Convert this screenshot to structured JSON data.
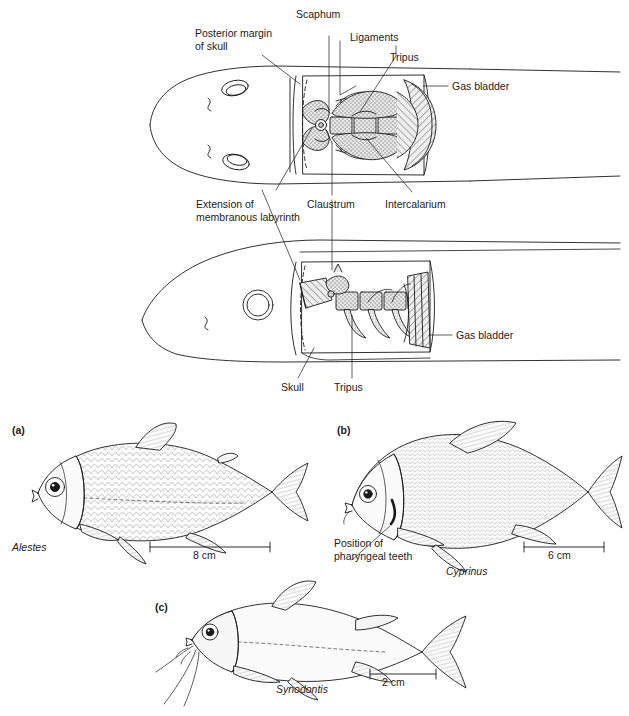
{
  "figure": {
    "background_color": "#ffffff",
    "line_color": "#1a1a1a",
    "stipple_fill": "#b8b8b8",
    "light_fill": "#f2f2f2",
    "hatch_fill": "#cccccc"
  },
  "diagram_dorsal": {
    "view": "dorsal view of fish head and Weberian apparatus",
    "labels": [
      {
        "id": "posterior-margin-of-skull",
        "line1": "Posterior margin",
        "line2": "of skull"
      },
      {
        "id": "scaphum",
        "text": "Scaphum"
      },
      {
        "id": "ligaments",
        "text": "Ligaments"
      },
      {
        "id": "tripus",
        "text": "Tripus"
      },
      {
        "id": "gas-bladder",
        "text": "Gas bladder"
      },
      {
        "id": "extension-of-membranous-labyrinth",
        "line1": "Extension of",
        "line2": "membranous labyrinth"
      },
      {
        "id": "claustrum",
        "text": "Claustrum"
      },
      {
        "id": "intercalarium",
        "text": "Intercalarium"
      }
    ]
  },
  "diagram_lateral": {
    "view": "lateral view of fish head and Weberian apparatus",
    "labels": [
      {
        "id": "gas-bladder",
        "text": "Gas bladder"
      },
      {
        "id": "skull",
        "text": "Skull"
      },
      {
        "id": "tripus",
        "text": "Tripus"
      }
    ]
  },
  "panels": [
    {
      "id": "a",
      "panel_label": "(a)",
      "species": "Alestes",
      "scale_bar": "8 cm",
      "annotation": null
    },
    {
      "id": "b",
      "panel_label": "(b)",
      "species": "Cyprinus",
      "scale_bar": "6 cm",
      "annotation": {
        "line1": "Position of",
        "line2": "pharyngeal teeth"
      }
    },
    {
      "id": "c",
      "panel_label": "(c)",
      "species": "Synodontis",
      "scale_bar": "2 cm",
      "annotation": null
    }
  ]
}
